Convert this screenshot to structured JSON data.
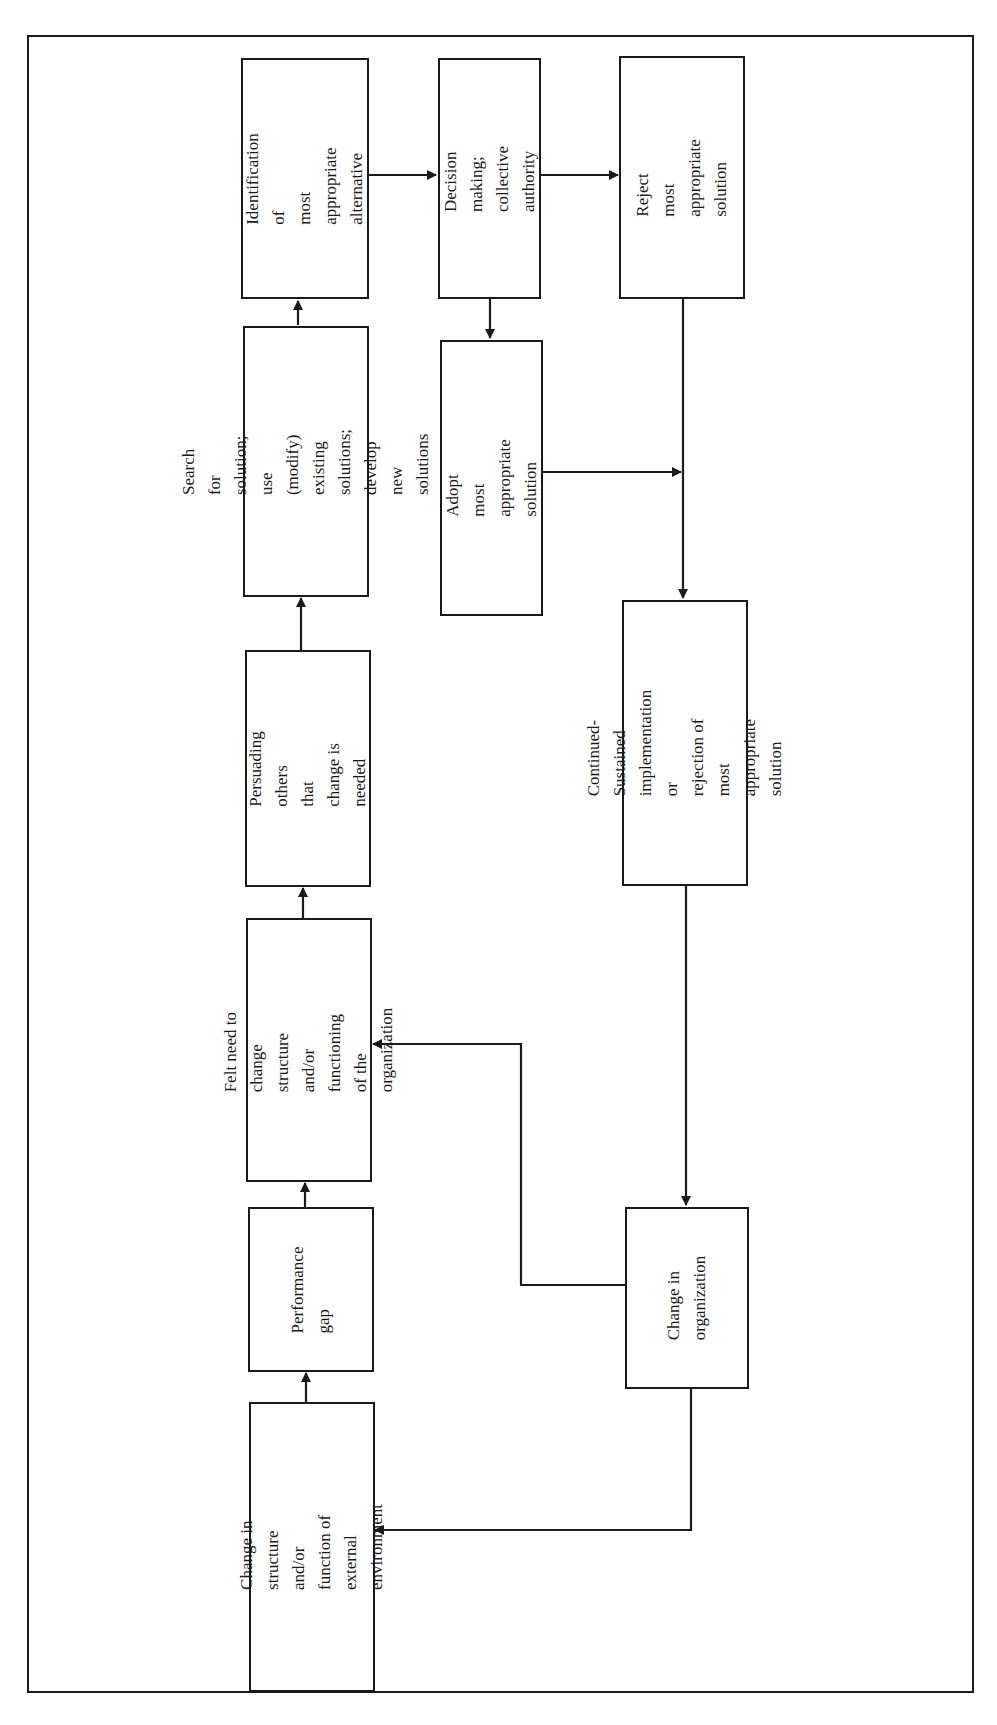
{
  "diagram": {
    "type": "flowchart",
    "orientation": "rotated-90-ccw",
    "boxes": {
      "identification": "Identification of\nmost appropriate\nalternative",
      "search": "Search for solution;\nuse (modify) existing\nsolutions; develop\nnew solutions",
      "persuading": "Persuading others\nthat change is\nneeded",
      "felt_need": "Felt need to change\nstructure and/or\nfunctioning of the\norganization",
      "performance_gap": "Performance\ngap",
      "external_change": "Change in structure\nand/or function of\nexternal environment",
      "decision": "Decision making;\ncollective\nauthority",
      "adopt": "Adopt most\nappropriate solution",
      "reject": "Reject most\nappropriate\nsolution",
      "continued": "Continued-Sustained\nimplementation or\nrejection of most\nappropriate solution",
      "org_change": "Change in\norganization"
    },
    "edges": [
      [
        "external_change",
        "performance_gap"
      ],
      [
        "performance_gap",
        "felt_need"
      ],
      [
        "felt_need",
        "persuading"
      ],
      [
        "persuading",
        "search"
      ],
      [
        "search",
        "identification"
      ],
      [
        "identification",
        "decision"
      ],
      [
        "decision",
        "reject"
      ],
      [
        "decision",
        "adopt"
      ],
      [
        "adopt",
        "continued"
      ],
      [
        "reject",
        "continued"
      ],
      [
        "continued",
        "org_change"
      ],
      [
        "org_change",
        "felt_need"
      ],
      [
        "org_change",
        "external_change"
      ]
    ],
    "colors": {
      "stroke": "#1a1a1a",
      "background": "#ffffff"
    }
  }
}
